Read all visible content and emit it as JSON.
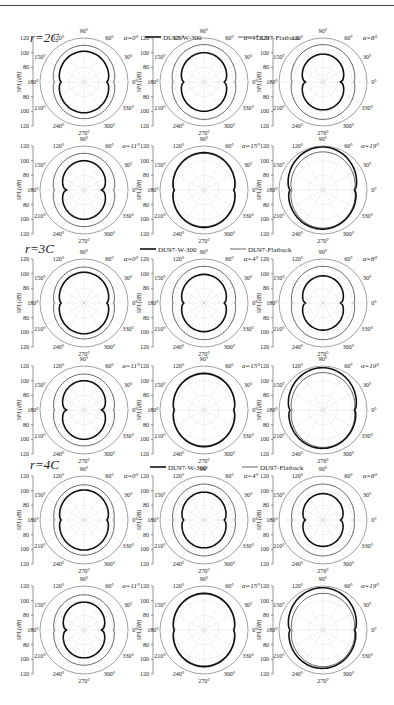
{
  "figure": {
    "legend": {
      "series": [
        {
          "name": "DU97-W-300",
          "stroke": "#111111",
          "width": 1.6
        },
        {
          "name": "DU97-Flatback",
          "stroke": "#555555",
          "width": 0.9
        }
      ]
    },
    "y_axis_label": "SPL(dB)",
    "y_ticks": [
      "120",
      "100",
      "80",
      "80",
      "100",
      "120"
    ],
    "angle_labels": [
      "0°",
      "30°",
      "60°",
      "90°",
      "120°",
      "150°",
      "180°",
      "210°",
      "240°",
      "270°",
      "300°",
      "330°"
    ],
    "sections": [
      {
        "label": "r=2C",
        "alphas": [
          "α=0°",
          "α=4°",
          "α=8°",
          "α=11°",
          "α=15°",
          "α=19°"
        ]
      },
      {
        "label": "r=3C",
        "alphas": [
          "α=0°",
          "α=4°",
          "α=8°",
          "α=11°",
          "α=15°",
          "α=19°"
        ]
      },
      {
        "label": "r=4C",
        "alphas": [
          "α=0°",
          "α=4°",
          "α=8°",
          "α=11°",
          "α=15°",
          "α=19°"
        ]
      }
    ]
  },
  "chart_data": {
    "type": "polar",
    "title": "",
    "radial_label": "SPL(dB)",
    "radial_ticks": [
      80,
      100,
      120
    ],
    "angular_ticks_deg": [
      0,
      30,
      60,
      90,
      120,
      150,
      180,
      210,
      240,
      270,
      300,
      330
    ],
    "legend": [
      "DU97-W-300",
      "DU97-Flatback"
    ],
    "legend_position": "top-center of each section",
    "grid": true,
    "panels_note": "3 sections (r=2C, 3C, 4C) × 6 angles of attack (α=0,4,8,11,15,19°). Values are approximate SPL at 90° (peak, dB) and 0° (notch, dB) for each series.",
    "panels": [
      {
        "section": "r=2C",
        "alpha": 0,
        "DU97-W-300": {
          "peak": 102,
          "notch": 94
        },
        "DU97-Flatback": {
          "peak": 110,
          "notch": 104
        }
      },
      {
        "section": "r=2C",
        "alpha": 4,
        "DU97-W-300": {
          "peak": 100,
          "notch": 90
        },
        "DU97-Flatback": {
          "peak": 111,
          "notch": 106
        }
      },
      {
        "section": "r=2C",
        "alpha": 8,
        "DU97-W-300": {
          "peak": 98,
          "notch": 86
        },
        "DU97-Flatback": {
          "peak": 111,
          "notch": 106
        }
      },
      {
        "section": "r=2C",
        "alpha": 11,
        "DU97-W-300": {
          "peak": 100,
          "notch": 86
        },
        "DU97-Flatback": {
          "peak": 110,
          "notch": 104
        }
      },
      {
        "section": "r=2C",
        "alpha": 15,
        "DU97-W-300": {
          "peak": 111,
          "notch": 104
        },
        "DU97-Flatback": {
          "peak": 110,
          "notch": 104
        }
      },
      {
        "section": "r=2C",
        "alpha": 19,
        "DU97-W-300": {
          "peak": 116,
          "notch": 108
        },
        "DU97-Flatback": {
          "peak": 112,
          "notch": 106
        }
      },
      {
        "section": "r=3C",
        "alpha": 0,
        "DU97-W-300": {
          "peak": 102,
          "notch": 94
        },
        "DU97-Flatback": {
          "peak": 109,
          "notch": 104
        }
      },
      {
        "section": "r=3C",
        "alpha": 4,
        "DU97-W-300": {
          "peak": 99,
          "notch": 90
        },
        "DU97-Flatback": {
          "peak": 110,
          "notch": 106
        }
      },
      {
        "section": "r=3C",
        "alpha": 8,
        "DU97-W-300": {
          "peak": 97,
          "notch": 86
        },
        "DU97-Flatback": {
          "peak": 110,
          "notch": 106
        }
      },
      {
        "section": "r=3C",
        "alpha": 11,
        "DU97-W-300": {
          "peak": 100,
          "notch": 86
        },
        "DU97-Flatback": {
          "peak": 109,
          "notch": 104
        }
      },
      {
        "section": "r=3C",
        "alpha": 15,
        "DU97-W-300": {
          "peak": 110,
          "notch": 104
        },
        "DU97-Flatback": {
          "peak": 109,
          "notch": 104
        }
      },
      {
        "section": "r=3C",
        "alpha": 19,
        "DU97-W-300": {
          "peak": 115,
          "notch": 108
        },
        "DU97-Flatback": {
          "peak": 111,
          "notch": 106
        }
      },
      {
        "section": "r=4C",
        "alpha": 0,
        "DU97-W-300": {
          "peak": 101,
          "notch": 94
        },
        "DU97-Flatback": {
          "peak": 108,
          "notch": 104
        }
      },
      {
        "section": "r=4C",
        "alpha": 4,
        "DU97-W-300": {
          "peak": 98,
          "notch": 90
        },
        "DU97-Flatback": {
          "peak": 109,
          "notch": 106
        }
      },
      {
        "section": "r=4C",
        "alpha": 8,
        "DU97-W-300": {
          "peak": 96,
          "notch": 86
        },
        "DU97-Flatback": {
          "peak": 109,
          "notch": 106
        }
      },
      {
        "section": "r=4C",
        "alpha": 11,
        "DU97-W-300": {
          "peak": 98,
          "notch": 86
        },
        "DU97-Flatback": {
          "peak": 108,
          "notch": 104
        }
      },
      {
        "section": "r=4C",
        "alpha": 15,
        "DU97-W-300": {
          "peak": 110,
          "notch": 104
        },
        "DU97-Flatback": {
          "peak": 109,
          "notch": 104
        }
      },
      {
        "section": "r=4C",
        "alpha": 19,
        "DU97-W-300": {
          "peak": 115,
          "notch": 108
        },
        "DU97-Flatback": {
          "peak": 110,
          "notch": 106
        }
      }
    ]
  }
}
